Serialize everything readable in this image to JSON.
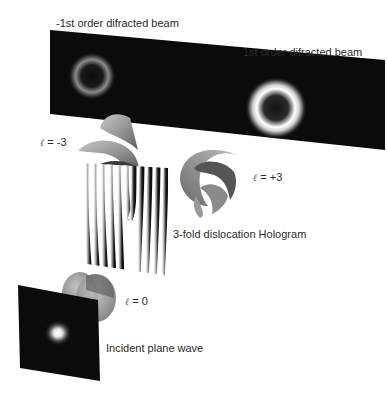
{
  "diagram": {
    "labels": {
      "minus_first_order": "-1st order difracted beam",
      "first_order": "1st order difracted beam",
      "hologram": "3-fold dislocation Hologram",
      "incident": "Incident plane wave",
      "l_minus3": "= -3",
      "l_plus3": "= +3",
      "l_zero": "= 0",
      "ell_symbol": "ℓ"
    },
    "elements": [
      {
        "id": "detector-screen",
        "content": [
          "dim donut ring (-1st order)",
          "bright donut ring (1st order)"
        ]
      },
      {
        "id": "helical-wavefront-l-minus3",
        "charge": -3
      },
      {
        "id": "helical-wavefront-l-plus3",
        "charge": 3
      },
      {
        "id": "fork-hologram",
        "fork_order": 3
      },
      {
        "id": "plane-wavefront-l0",
        "charge": 0
      },
      {
        "id": "incident-screen",
        "content": "gaussian spot"
      }
    ],
    "colors": {
      "screen": "#0b0b0b",
      "ring_dim": "#8a8a8a",
      "ring_bright": "#ffffff",
      "wavefront": "#9a9a9a",
      "text": "#2a2a2a"
    }
  }
}
